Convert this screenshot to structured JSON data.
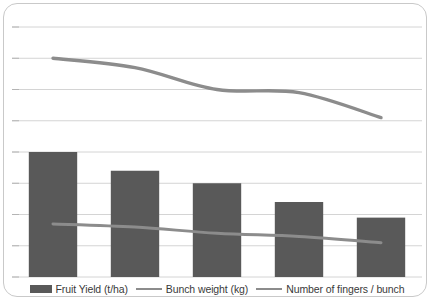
{
  "chart_data": {
    "type": "bar",
    "title": "",
    "xlabel": "",
    "ylabel": "",
    "categories": [
      "1",
      "2",
      "3",
      "4",
      "5"
    ],
    "grid": true,
    "legend_position": "bottom",
    "ylim": [
      0,
      80
    ],
    "gridline_values": [
      80,
      70,
      60,
      50,
      40,
      30,
      20,
      10,
      0
    ],
    "series": [
      {
        "name": "Fruit Yield (t/ha)",
        "type": "bar",
        "color": "#595959",
        "values": [
          40,
          34,
          30,
          24,
          19
        ]
      },
      {
        "name": "Bunch weight (kg)",
        "type": "line",
        "color": "#8c8c8c",
        "values": [
          17,
          16,
          14,
          13,
          11
        ]
      },
      {
        "name": "Number of fingers / bunch",
        "type": "line",
        "color": "#8c8c8c",
        "values": [
          70,
          67,
          60,
          59,
          51
        ]
      }
    ]
  },
  "legend": {
    "items": [
      {
        "label": "Fruit Yield (t/ha)",
        "marker": "bar-swatch",
        "color": "#595959"
      },
      {
        "label": "Bunch weight (kg)",
        "marker": "line-swatch",
        "color": "#8c8c8c"
      },
      {
        "label": "Number of fingers / bunch",
        "marker": "line-swatch",
        "color": "#8c8c8c"
      }
    ]
  },
  "colors": {
    "bar": "#595959",
    "line": "#8c8c8c",
    "grid": "#d4d4d4",
    "frame": "#c9c9c9",
    "background": "#ffffff"
  }
}
